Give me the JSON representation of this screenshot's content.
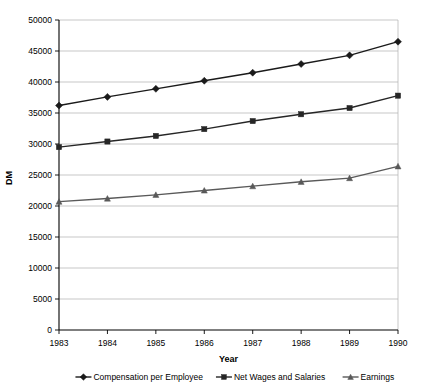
{
  "chart_data": {
    "type": "line",
    "title": "",
    "xlabel": "Year",
    "ylabel": "DM",
    "categories": [
      1983,
      1984,
      1985,
      1986,
      1987,
      1988,
      1989,
      1990
    ],
    "x": [
      "1983",
      "1984",
      "1985",
      "1986",
      "1987",
      "1988",
      "1989",
      "1990"
    ],
    "ylim": [
      0,
      50000
    ],
    "yticks": [
      0,
      5000,
      10000,
      15000,
      20000,
      25000,
      30000,
      35000,
      40000,
      45000,
      50000
    ],
    "ytick_labels": [
      "0",
      "5000",
      "10000",
      "15000",
      "20000",
      "25000",
      "30000",
      "35000",
      "40000",
      "45000",
      "50000"
    ],
    "grid": true,
    "legend_position": "bottom",
    "series": [
      {
        "name": "Compensation per Employee",
        "marker": "diamond",
        "color": "#1a1a1a",
        "values": [
          36200,
          37600,
          38900,
          40200,
          41500,
          42900,
          44300,
          46500
        ]
      },
      {
        "name": "Net Wages and Salaries",
        "marker": "square",
        "color": "#262626",
        "values": [
          29500,
          30400,
          31300,
          32400,
          33700,
          34800,
          35800,
          37800
        ]
      },
      {
        "name": "Earnings",
        "marker": "triangle",
        "color": "#595959",
        "values": [
          20700,
          21200,
          21800,
          22500,
          23200,
          23900,
          24500,
          26400
        ]
      }
    ]
  },
  "axes": {
    "y_title": "DM",
    "x_title": "Year"
  },
  "legend": {
    "items": [
      {
        "label": "Compensation per Employee",
        "marker": "diamond-marker-icon"
      },
      {
        "label": "Net Wages and Salaries",
        "marker": "square-marker-icon"
      },
      {
        "label": "Earnings",
        "marker": "triangle-marker-icon"
      }
    ]
  }
}
